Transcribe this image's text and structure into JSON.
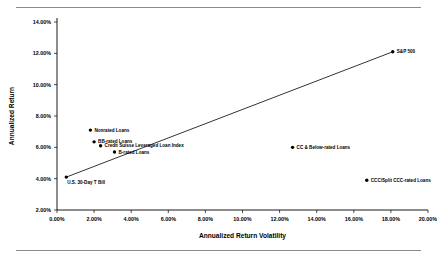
{
  "chart_data": {
    "type": "scatter",
    "title": "",
    "xlabel": "Annualized Return Volatility",
    "ylabel": "Annualized Return",
    "xlim": [
      0.0,
      20.0
    ],
    "ylim": [
      2.0,
      14.0
    ],
    "grid": false,
    "legend": "none",
    "x_tick_labels": [
      "0.00%",
      "2.00%",
      "4.00%",
      "6.00%",
      "8.00%",
      "10.00%",
      "12.00%",
      "14.00%",
      "16.00%",
      "18.00%",
      "20.00%"
    ],
    "x_ticks": [
      0,
      2,
      4,
      6,
      8,
      10,
      12,
      14,
      16,
      18,
      20
    ],
    "y_tick_labels": [
      "2.00%",
      "4.00%",
      "6.00%",
      "8.00%",
      "10.00%",
      "12.00%",
      "14.00%"
    ],
    "y_ticks": [
      2,
      4,
      6,
      8,
      10,
      12,
      14
    ],
    "points": [
      {
        "label": "U.S. 30-Day T Bill",
        "x": 0.5,
        "y": 4.1,
        "label_dx": 1,
        "label_dy": 7,
        "anchor": "start"
      },
      {
        "label": "Nonrated Loans",
        "x": 1.8,
        "y": 7.1,
        "label_dx": 4,
        "label_dy": 1.6,
        "anchor": "start"
      },
      {
        "label": "BB-rated Loans",
        "x": 2.0,
        "y": 6.35,
        "label_dx": 4,
        "label_dy": 1.6,
        "anchor": "start"
      },
      {
        "label": "Credit Suisse Leveraged Loan Index",
        "x": 2.35,
        "y": 6.1,
        "label_dx": 4,
        "label_dy": 1.6,
        "anchor": "start"
      },
      {
        "label": "B-rated Loans",
        "x": 3.1,
        "y": 5.7,
        "label_dx": 4,
        "label_dy": 1.6,
        "anchor": "start"
      },
      {
        "label": "CC & Below-rated Loans",
        "x": 12.7,
        "y": 6.0,
        "label_dx": 4,
        "label_dy": 1.6,
        "anchor": "start"
      },
      {
        "label": "CCC/Split CCC-rated Loans",
        "x": 16.7,
        "y": 3.9,
        "label_dx": 4,
        "label_dy": 1.6,
        "anchor": "start"
      },
      {
        "label": "S&P 500",
        "x": 18.1,
        "y": 12.1,
        "label_dx": 4,
        "label_dy": 1.6,
        "anchor": "start"
      }
    ],
    "trend_line": {
      "name": "trendline",
      "x0": 0.5,
      "y0": 4.1,
      "x1": 18.1,
      "y1": 12.1
    }
  }
}
